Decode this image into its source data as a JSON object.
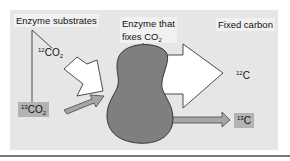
{
  "diagram": {
    "labels": {
      "enzyme_substrates": "Enzyme substrates",
      "enzyme_title_line1": "Enzyme that",
      "enzyme_title_line2_text": "fixes CO",
      "enzyme_title_line2_sub": "2",
      "fixed_carbon": "Fixed carbon"
    },
    "substrates": [
      {
        "mass": "12",
        "formula": "CO",
        "sub": "2"
      },
      {
        "mass": "13",
        "formula": "CO",
        "sub": "2"
      }
    ],
    "products": [
      {
        "mass": "12",
        "element": "C"
      },
      {
        "mass": "13",
        "element": "C"
      }
    ],
    "colors": {
      "panel": "#e6e6e6",
      "enzyme": "#7f7f7f",
      "arrow_light": "#ffffff",
      "arrow_dark": "#a6a6a6",
      "label_dark_bg": "#b3b3b3",
      "rule": "#7a7a7a"
    }
  }
}
